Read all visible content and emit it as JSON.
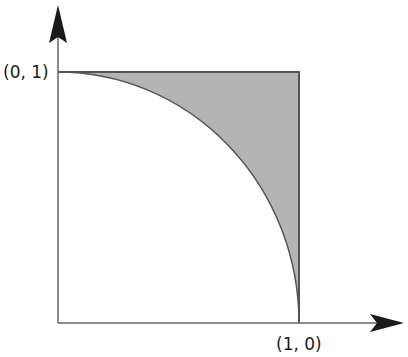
{
  "diagram": {
    "labels": {
      "top_left": "(0, 1)",
      "bottom_right": "(1, 0)"
    },
    "colors": {
      "axis": "#555555",
      "arrowhead": "#1a1a1a",
      "shade": "#b4b4b4",
      "outline": "#555555"
    }
  }
}
